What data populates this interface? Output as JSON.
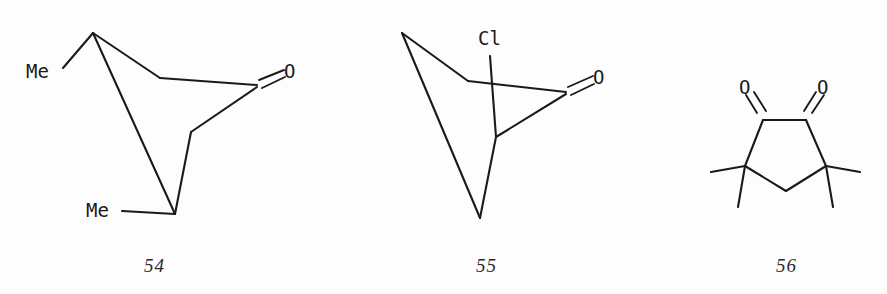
{
  "figure": {
    "background_color": "#fdfdfd",
    "ink_color": "#1a1a1a",
    "caption_color": "#2b2b2b",
    "structure_count": 3
  },
  "structures": [
    {
      "caption": "54",
      "name": "dimethyl-bicyclic-ketone",
      "atom_labels": [
        {
          "text": "Me",
          "name": "methyl-label-upper-left"
        },
        {
          "text": "Me",
          "name": "methyl-label-lower-left"
        },
        {
          "text": "O",
          "name": "carbonyl-oxygen-label"
        }
      ]
    },
    {
      "caption": "55",
      "name": "chloro-bicyclic-ketone",
      "atom_labels": [
        {
          "text": "Cl",
          "name": "chlorine-label"
        },
        {
          "text": "O",
          "name": "carbonyl-oxygen-label"
        }
      ]
    },
    {
      "caption": "56",
      "name": "tetramethyl-cyclopentane-dione",
      "atom_labels": [
        {
          "text": "O",
          "name": "carbonyl-oxygen-label-left"
        },
        {
          "text": "O",
          "name": "carbonyl-oxygen-label-right"
        }
      ]
    }
  ],
  "captions": {
    "structure_54": "54",
    "structure_55": "55",
    "structure_56": "56"
  },
  "labels": {
    "me_upper_left_54": "Me",
    "me_lower_left_54": "Me",
    "o_54": "O",
    "cl_55": "Cl",
    "o_55": "O",
    "o_left_56": "O",
    "o_right_56": "O"
  }
}
